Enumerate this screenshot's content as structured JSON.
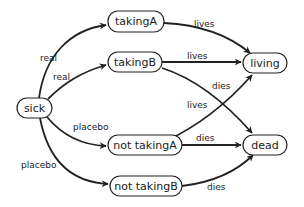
{
  "diagram": {
    "type": "state-transition-graph",
    "nodes": {
      "sick": {
        "label": "sick",
        "x": 17,
        "y": 98,
        "w": 35,
        "h": 20
      },
      "takingA": {
        "label": "takingA",
        "x": 108,
        "y": 11,
        "w": 56,
        "h": 21
      },
      "takingB": {
        "label": "takingB",
        "x": 108,
        "y": 52,
        "w": 54,
        "h": 20
      },
      "not_takingA": {
        "label": "not takingA",
        "x": 108,
        "y": 141,
        "w": 74,
        "h": 20
      },
      "not_takingB": {
        "label": "not takingB",
        "x": 110,
        "y": 176,
        "w": 72,
        "h": 20
      },
      "living": {
        "label": "living",
        "x": 243,
        "y": 54,
        "w": 44,
        "h": 20
      },
      "dead": {
        "label": "dead",
        "x": 243,
        "y": 134,
        "w": 44,
        "h": 20
      }
    },
    "edges": {
      "sick_takingA": {
        "from": "sick",
        "to": "takingA",
        "label": "real"
      },
      "sick_takingB": {
        "from": "sick",
        "to": "takingB",
        "label": "real"
      },
      "sick_not_takingA": {
        "from": "sick",
        "to": "not takingA",
        "label": "placebo"
      },
      "sick_not_takingB": {
        "from": "sick",
        "to": "not takingB",
        "label": "placebo"
      },
      "takingA_living": {
        "from": "takingA",
        "to": "living",
        "label": "lives"
      },
      "takingB_living": {
        "from": "takingB",
        "to": "living",
        "label": "lives"
      },
      "takingB_dead": {
        "from": "takingB",
        "to": "dead",
        "label": "dies"
      },
      "not_takingA_living": {
        "from": "not takingA",
        "to": "living",
        "label": "lives"
      },
      "not_takingA_dead": {
        "from": "not takingA",
        "to": "dead",
        "label": "dies"
      },
      "not_takingB_dead": {
        "from": "not takingB",
        "to": "dead",
        "label": "dies"
      }
    }
  }
}
